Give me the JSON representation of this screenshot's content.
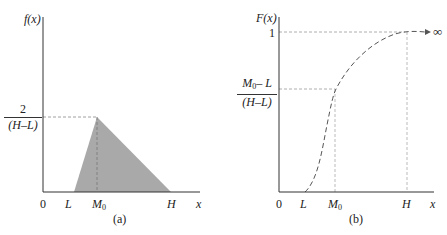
{
  "figure": {
    "panel_a": {
      "caption": "(a)",
      "y_axis_label": "f(x)",
      "x_axis_label": "x",
      "origin_label": "0",
      "x_ticks": {
        "L": "L",
        "M0_base": "M",
        "M0_sub": "0",
        "H": "H"
      },
      "y_peak_label": {
        "numerator": "2",
        "denominator": "(H–L)"
      },
      "shape": "triangle",
      "fill_color": "#a9a9a9"
    },
    "panel_b": {
      "caption": "(b)",
      "y_axis_label": "F(x)",
      "x_axis_label": "x",
      "origin_label": "0",
      "x_ticks": {
        "L": "L",
        "M0_base": "M",
        "M0_sub": "0",
        "H": "H"
      },
      "y_one_label": "1",
      "y_mid_label": {
        "numerator_base": "M",
        "numerator_sub": "0",
        "numerator_rest": "– L",
        "denominator": "(H–L)"
      },
      "arrow_label": "∞",
      "curve_style": "dashed",
      "line_color": "#555555"
    }
  }
}
